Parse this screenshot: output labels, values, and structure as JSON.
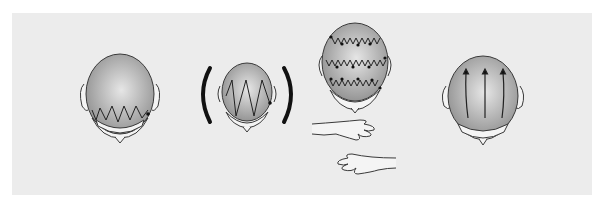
{
  "figure": {
    "panels": [
      {
        "id": "zigzag-lower-back",
        "technique": "zigzag strokes along lower back of head"
      },
      {
        "id": "zigzag-large-both-sides",
        "technique": "large zigzag strokes, applied with both hands (brackets)"
      },
      {
        "id": "zigzag-rows-with-hands",
        "technique": "three rows of small zigzag strokes with dots, using hands"
      },
      {
        "id": "vertical-strokes",
        "technique": "three vertical upward strokes (arrows)"
      }
    ],
    "colors": {
      "background": "#ffffff",
      "panel": "#ececec",
      "scalp_light": "#e6e6e6",
      "scalp_dark": "#8e8e8e",
      "skin": "#f4f4f4",
      "outline": "#3a3a3a",
      "stroke": "#222222"
    }
  }
}
